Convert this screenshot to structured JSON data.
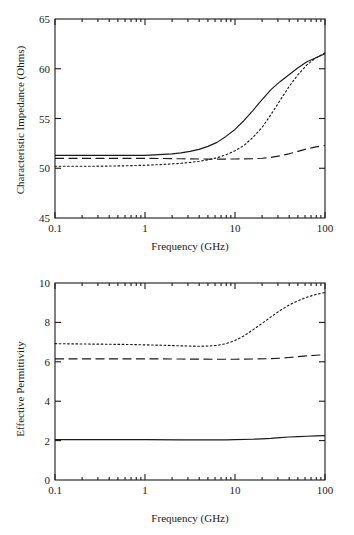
{
  "figure": {
    "title": "",
    "background": "#ffffff",
    "ink_color": "#1a1a1a"
  },
  "chart_data": [
    {
      "id": "impedance",
      "type": "line",
      "title": "",
      "xlabel": "Frequency   (GHz)",
      "ylabel": "Characteristic   Impedance   (Ohms)",
      "xscale": "log",
      "xlim": [
        0.1,
        100
      ],
      "ylim": [
        45,
        65
      ],
      "xticks": [
        0.1,
        1,
        10,
        100
      ],
      "xtick_labels": [
        "0.1",
        "1",
        "10",
        "100"
      ],
      "yticks": [
        45,
        50,
        55,
        60,
        65
      ],
      "ytick_labels": [
        "45",
        "50",
        "55",
        "60",
        "65"
      ],
      "grid": false,
      "legend": "none",
      "series": [
        {
          "name": "solid",
          "style": "solid",
          "x": [
            0.1,
            0.158,
            0.251,
            0.398,
            0.631,
            1.0,
            1.26,
            1.58,
            2.0,
            2.51,
            3.16,
            3.98,
            5.01,
            6.31,
            7.94,
            10.0,
            12.6,
            15.8,
            20.0,
            25.1,
            31.6,
            39.8,
            50.1,
            63.1,
            79.4,
            100.0
          ],
          "y": [
            51.3,
            51.3,
            51.3,
            51.3,
            51.3,
            51.3,
            51.35,
            51.4,
            51.45,
            51.55,
            51.7,
            51.9,
            52.2,
            52.6,
            53.2,
            53.9,
            54.8,
            55.8,
            56.9,
            57.9,
            58.7,
            59.4,
            60.1,
            60.7,
            61.1,
            61.5
          ]
        },
        {
          "name": "dashed",
          "style": "dashed",
          "x": [
            0.1,
            0.158,
            0.251,
            0.398,
            0.631,
            1.0,
            1.58,
            2.51,
            3.98,
            6.31,
            10.0,
            15.8,
            20.0,
            25.1,
            31.6,
            39.8,
            50.1,
            63.1,
            79.4,
            100.0
          ],
          "y": [
            51.0,
            51.0,
            51.0,
            51.0,
            51.0,
            51.0,
            50.98,
            50.95,
            50.93,
            50.92,
            50.93,
            50.96,
            51.0,
            51.1,
            51.25,
            51.45,
            51.7,
            51.95,
            52.15,
            52.3
          ]
        },
        {
          "name": "dotted",
          "style": "dotted",
          "x": [
            0.1,
            0.158,
            0.251,
            0.398,
            0.631,
            1.0,
            1.58,
            2.51,
            3.16,
            3.98,
            5.01,
            6.31,
            7.94,
            10.0,
            12.6,
            15.8,
            20.0,
            25.1,
            31.6,
            39.8,
            50.1,
            63.1,
            79.4,
            100.0
          ],
          "y": [
            50.2,
            50.2,
            50.2,
            50.22,
            50.25,
            50.3,
            50.38,
            50.5,
            50.58,
            50.7,
            50.85,
            51.05,
            51.35,
            51.75,
            52.3,
            53.1,
            54.1,
            55.4,
            56.8,
            58.2,
            59.4,
            60.4,
            61.1,
            61.6
          ]
        }
      ]
    },
    {
      "id": "permittivity",
      "type": "line",
      "title": "",
      "xlabel": "Frequency   (GHz)",
      "ylabel": "Effective  Permittivity",
      "xscale": "log",
      "xlim": [
        0.1,
        100
      ],
      "ylim": [
        0,
        10
      ],
      "xticks": [
        0.1,
        1,
        10,
        100
      ],
      "xtick_labels": [
        "0.1",
        "1",
        "10",
        "100"
      ],
      "yticks": [
        0,
        2,
        4,
        6,
        8,
        10
      ],
      "ytick_labels": [
        "0",
        "2",
        "4",
        "6",
        "8",
        "10"
      ],
      "grid": false,
      "legend": "none",
      "series": [
        {
          "name": "dotted",
          "style": "dotted",
          "x": [
            0.1,
            0.251,
            0.631,
            1.0,
            1.58,
            2.51,
            3.98,
            5.01,
            6.31,
            7.94,
            10.0,
            12.6,
            15.8,
            20.0,
            25.1,
            31.6,
            39.8,
            50.1,
            63.1,
            79.4,
            100.0
          ],
          "y": [
            6.92,
            6.9,
            6.88,
            6.86,
            6.84,
            6.81,
            6.79,
            6.8,
            6.83,
            6.92,
            7.08,
            7.32,
            7.62,
            7.95,
            8.28,
            8.6,
            8.88,
            9.1,
            9.28,
            9.42,
            9.52
          ]
        },
        {
          "name": "dashed",
          "style": "dashed",
          "x": [
            0.1,
            0.398,
            1.0,
            2.51,
            6.31,
            10.0,
            15.8,
            25.1,
            31.6,
            39.8,
            50.1,
            63.1,
            79.4,
            100.0
          ],
          "y": [
            6.15,
            6.15,
            6.15,
            6.14,
            6.13,
            6.13,
            6.14,
            6.16,
            6.18,
            6.22,
            6.26,
            6.3,
            6.33,
            6.36
          ]
        },
        {
          "name": "solid",
          "style": "solid",
          "x": [
            0.1,
            0.398,
            1.0,
            2.51,
            5.01,
            7.94,
            10.0,
            15.8,
            20.0,
            25.1,
            31.6,
            39.8,
            50.1,
            63.1,
            79.4,
            100.0
          ],
          "y": [
            2.05,
            2.05,
            2.05,
            2.04,
            2.04,
            2.04,
            2.05,
            2.07,
            2.09,
            2.11,
            2.15,
            2.18,
            2.2,
            2.22,
            2.24,
            2.25
          ]
        }
      ]
    }
  ]
}
